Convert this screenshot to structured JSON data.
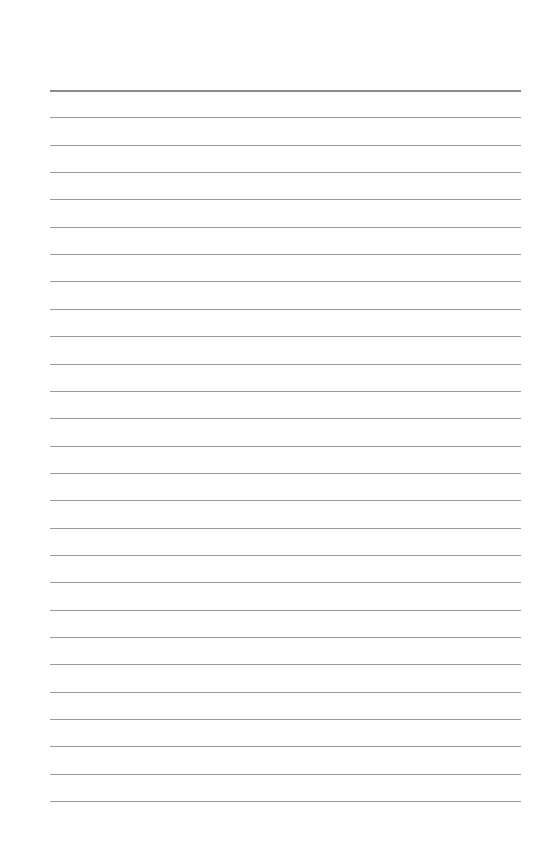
{
  "paper": {
    "type": "lined-paper",
    "line_count": 27,
    "first_line_y": 90,
    "line_spacing": 27.35,
    "line_left": 50,
    "line_width": 471,
    "line_color": "#9a9a9a",
    "background": "#fefefe"
  }
}
